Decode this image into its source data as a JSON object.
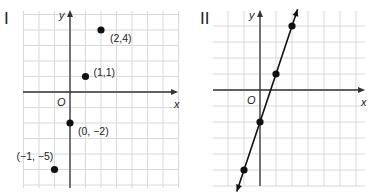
{
  "chart_data": [
    {
      "type": "scatter",
      "title": "I",
      "xlabel": "x",
      "ylabel": "y",
      "origin_label": "O",
      "grid": true,
      "xlim": [
        -3,
        7
      ],
      "ylim": [
        -6,
        5
      ],
      "points": [
        {
          "x": 2,
          "y": 4,
          "label": "(2,4)"
        },
        {
          "x": 1,
          "y": 1,
          "label": "(1,1)"
        },
        {
          "x": 0,
          "y": -2,
          "label": "(0, −2)"
        },
        {
          "x": -1,
          "y": -5,
          "label": "(−1, −5)"
        }
      ]
    },
    {
      "type": "line",
      "title": "II",
      "xlabel": "x",
      "ylabel": "y",
      "origin_label": "O",
      "grid": true,
      "xlim": [
        -3,
        6
      ],
      "ylim": [
        -6,
        5
      ],
      "points": [
        {
          "x": 2,
          "y": 4
        },
        {
          "x": 1,
          "y": 1
        },
        {
          "x": 0,
          "y": -2
        },
        {
          "x": -1,
          "y": -5
        }
      ],
      "line": {
        "equation": "y = 3x - 2",
        "arrows": "both"
      }
    }
  ],
  "panels": {
    "left": {
      "label": "I"
    },
    "right": {
      "label": "II"
    }
  },
  "colors": {
    "point": "#111111",
    "axis": "#333333",
    "grid": "#d9d9d9"
  }
}
